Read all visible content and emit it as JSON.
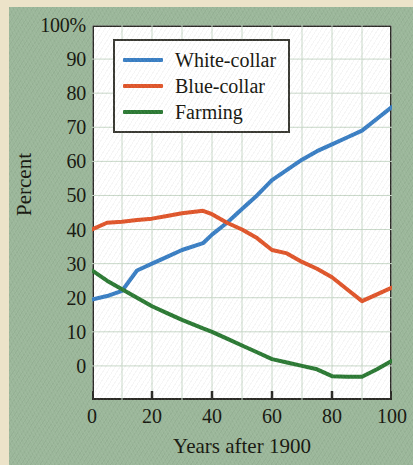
{
  "figure": {
    "background_color": "#9bb79a",
    "margin_color": "#ece3c9",
    "plot_background": "#ffffff"
  },
  "chart_data": {
    "type": "line",
    "title": "",
    "subtitle": "",
    "xlabel": "Years after 1900",
    "ylabel": "Percent",
    "xlim": [
      0,
      100
    ],
    "ylim": [
      -10,
      100
    ],
    "xticks": [
      "0",
      "20",
      "40",
      "60",
      "80",
      "100"
    ],
    "xtick_values": [
      0,
      20,
      40,
      60,
      80,
      100
    ],
    "yticks": [
      "0",
      "10",
      "20",
      "30",
      "40",
      "50",
      "60",
      "70",
      "80",
      "90",
      "100%"
    ],
    "ytick_values": [
      0,
      10,
      20,
      30,
      40,
      50,
      60,
      70,
      80,
      90,
      100
    ],
    "grid": true,
    "grid_color": "#c8d8c8",
    "legend_position": "upper-left-inside",
    "x": [
      0,
      5,
      10,
      15,
      20,
      25,
      30,
      37,
      40,
      45,
      50,
      55,
      60,
      65,
      70,
      75,
      80,
      85,
      90,
      95,
      100
    ],
    "series": [
      {
        "name": "White-collar",
        "color": "#3a7fc4",
        "values": [
          19.5,
          20.5,
          22.0,
          28.0,
          30.0,
          32.0,
          34.0,
          36.0,
          38.5,
          42.0,
          46.0,
          50.0,
          54.5,
          57.5,
          60.5,
          63.0,
          65.0,
          67.0,
          69.0,
          72.5,
          76.0
        ]
      },
      {
        "name": "Blue-collar",
        "color": "#e0562b",
        "values": [
          40.0,
          42.0,
          42.3,
          42.8,
          43.2,
          44.0,
          44.8,
          45.5,
          44.5,
          42.0,
          40.0,
          37.5,
          34.0,
          33.0,
          30.5,
          28.5,
          26.0,
          22.5,
          19.0,
          21.0,
          23.0
        ]
      },
      {
        "name": "Farming",
        "color": "#2c7a34",
        "values": [
          28.0,
          25.0,
          22.5,
          20.0,
          17.5,
          15.5,
          13.5,
          11.0,
          10.0,
          8.0,
          6.0,
          4.0,
          2.0,
          1.0,
          0.0,
          -1.0,
          -3.0,
          -3.2,
          -3.2,
          -1.0,
          1.5
        ]
      }
    ]
  },
  "legend": {
    "items": [
      {
        "label": "White-collar",
        "color": "#3a7fc4"
      },
      {
        "label": "Blue-collar",
        "color": "#e0562b"
      },
      {
        "label": "Farming",
        "color": "#2c7a34"
      }
    ]
  }
}
